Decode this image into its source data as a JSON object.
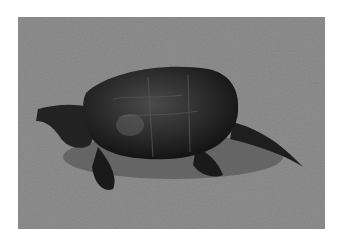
{
  "image": {
    "subject": "snapping turtle on grass",
    "style": "grayscale photograph",
    "alt": "A snapping turtle walking across a grassy lawn"
  }
}
